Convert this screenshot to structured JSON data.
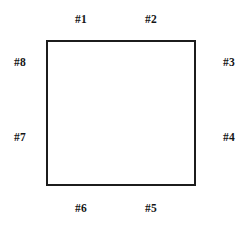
{
  "diagram": {
    "shape": {
      "type": "square",
      "fill_color": "#ffffff",
      "stroke_color": "#1c1c1c",
      "stroke_width": 2
    },
    "background_color": "#ffffff",
    "text_color": "#151515",
    "labels": {
      "top_left": "#1",
      "top_right": "#2",
      "right_top": "#3",
      "right_bottom": "#4",
      "bottom_right": "#5",
      "bottom_left": "#6",
      "left_bottom": "#7",
      "left_top": "#8"
    }
  }
}
